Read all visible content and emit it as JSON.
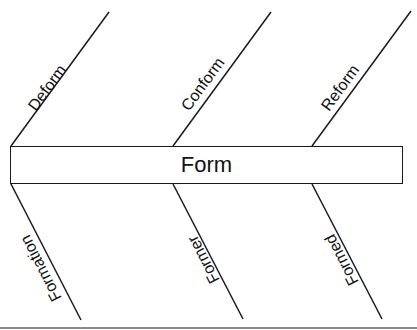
{
  "diagram": {
    "type": "fishbone",
    "center": {
      "label": "Form"
    },
    "upper_branches": [
      {
        "label": "Deform"
      },
      {
        "label": "Conform"
      },
      {
        "label": "Reform"
      }
    ],
    "lower_branches": [
      {
        "label": "Formation"
      },
      {
        "label": "Former"
      },
      {
        "label": "Formed"
      }
    ],
    "colors": {
      "line": "#1a1a1a",
      "text": "#111111",
      "background": "#ffffff",
      "bottom_rule": "#8a8a8a"
    }
  }
}
